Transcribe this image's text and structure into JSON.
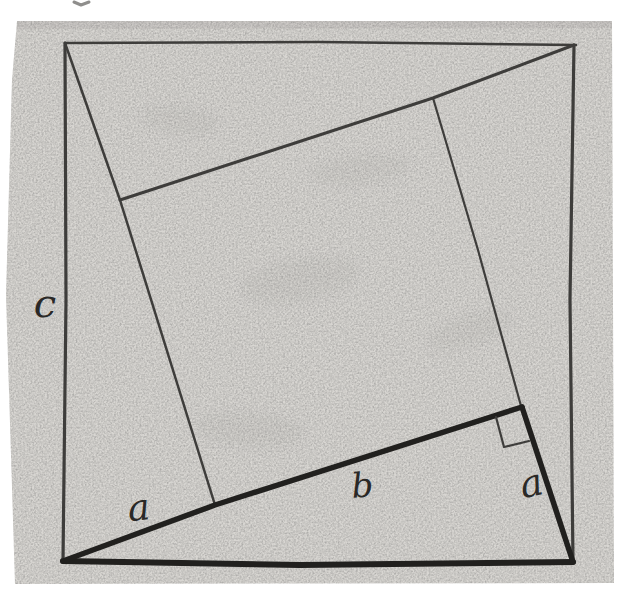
{
  "figure": {
    "canvas": {
      "width": 618,
      "height": 605
    },
    "colors": {
      "background": "#ffffff",
      "paper": "#d8d6d2",
      "paper_edge_shade": "#c2c0bc",
      "ink_dark": "#21201e",
      "ink_medium": "#3e3d3b",
      "label_ink": "#2a2927",
      "stray_mark": "#8f8e8c"
    },
    "paper": {
      "points": [
        [
          17,
          21
        ],
        [
          612,
          21
        ],
        [
          614,
          583
        ],
        [
          15,
          584
        ],
        [
          6,
          295
        ],
        [
          12,
          80
        ]
      ]
    },
    "labels": [
      {
        "name": "label-c",
        "text": "c",
        "x": 45,
        "y": 317,
        "font_size": 40,
        "rotate": 0
      },
      {
        "name": "label-a-left",
        "text": "a",
        "x": 140,
        "y": 520,
        "font_size": 37,
        "rotate": -6
      },
      {
        "name": "label-b",
        "text": "b",
        "x": 363,
        "y": 497,
        "font_size": 34,
        "rotate": -4
      },
      {
        "name": "label-a-right",
        "text": "a",
        "x": 534,
        "y": 496,
        "font_size": 38,
        "rotate": -13
      }
    ],
    "lines": [
      {
        "name": "outer-square-top-edge",
        "points": [
          [
            65,
            43
          ],
          [
            320,
            42
          ],
          [
            576,
            45
          ]
        ],
        "width": 2.6,
        "color_key": "ink_medium"
      },
      {
        "name": "outer-square-right-edge",
        "points": [
          [
            574,
            45
          ],
          [
            570,
            300
          ],
          [
            573,
            562
          ]
        ],
        "width": 3.2,
        "color_key": "ink_medium"
      },
      {
        "name": "outer-square-bottom-edge",
        "points": [
          [
            63,
            561
          ],
          [
            300,
            565
          ],
          [
            573,
            562
          ]
        ],
        "width": 6.0,
        "color_key": "ink_dark"
      },
      {
        "name": "outer-square-left-edge",
        "points": [
          [
            65,
            43
          ],
          [
            66,
            300
          ],
          [
            63,
            561
          ]
        ],
        "width": 3.2,
        "color_key": "ink_medium"
      },
      {
        "name": "pinwheel-side-topleft-down",
        "points": [
          [
            65,
            43
          ],
          [
            120,
            200
          ],
          [
            215,
            505
          ]
        ],
        "width": 2.5,
        "color_key": "ink_medium"
      },
      {
        "name": "pinwheel-long-diagonal",
        "points": [
          [
            120,
            200
          ],
          [
            433,
            98
          ],
          [
            574,
            45
          ]
        ],
        "width": 3.0,
        "color_key": "ink_medium"
      },
      {
        "name": "inner-square-right-side",
        "points": [
          [
            433,
            98
          ],
          [
            478,
            250
          ],
          [
            521,
            406
          ]
        ],
        "width": 2.2,
        "color_key": "ink_medium"
      },
      {
        "name": "triangle-leg-b-thick",
        "points": [
          [
            63,
            561
          ],
          [
            215,
            505
          ],
          [
            522,
            407
          ]
        ],
        "width": 5.5,
        "color_key": "ink_dark"
      },
      {
        "name": "triangle-leg-a-thick",
        "points": [
          [
            522,
            407
          ],
          [
            573,
            562
          ]
        ],
        "width": 5.5,
        "color_key": "ink_dark"
      },
      {
        "name": "right-angle-mark",
        "points": [
          [
            496,
            417
          ],
          [
            504,
            447
          ],
          [
            529,
            441
          ]
        ],
        "width": 2.2,
        "color_key": "ink_medium"
      },
      {
        "name": "stray-mark-top",
        "points": [
          [
            74,
            2
          ],
          [
            81,
            5
          ],
          [
            89,
            2
          ]
        ],
        "width": 3.0,
        "color_key": "stray_mark"
      }
    ],
    "smudges": [
      {
        "cx": 300,
        "cy": 280,
        "rx": 60,
        "ry": 22,
        "rotate": -10
      },
      {
        "cx": 180,
        "cy": 120,
        "rx": 40,
        "ry": 14,
        "rotate": 8
      },
      {
        "cx": 470,
        "cy": 330,
        "rx": 45,
        "ry": 16,
        "rotate": -18
      },
      {
        "cx": 360,
        "cy": 170,
        "rx": 50,
        "ry": 15,
        "rotate": -6
      },
      {
        "cx": 250,
        "cy": 430,
        "rx": 55,
        "ry": 18,
        "rotate": 5
      }
    ]
  }
}
